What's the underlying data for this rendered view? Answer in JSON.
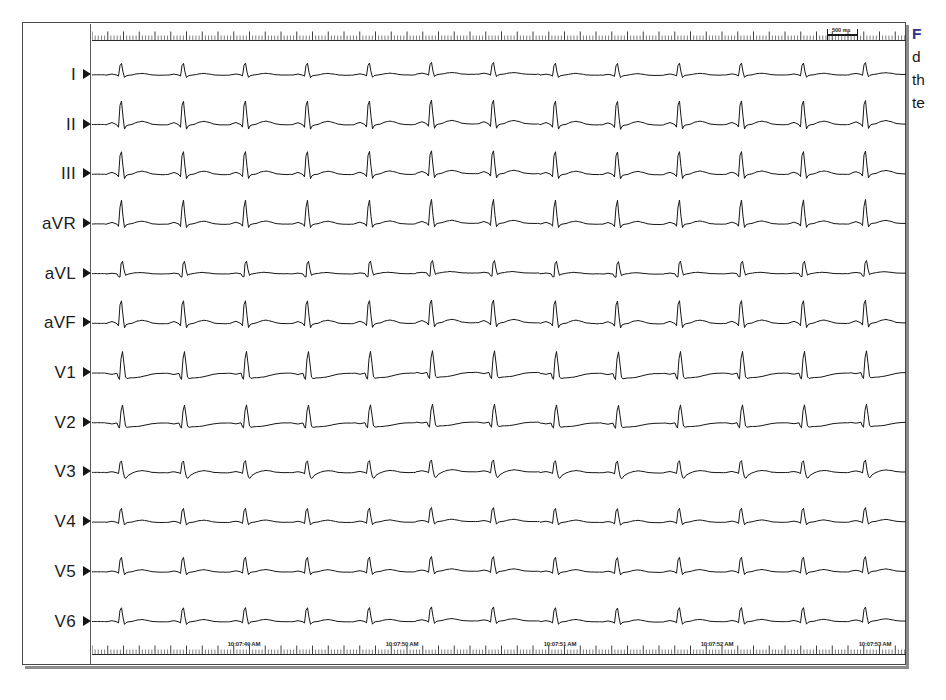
{
  "figure": {
    "kind": "12-lead-electrocardiogram",
    "caption_lead": "F",
    "caption_lines": [
      "d",
      "th",
      "te"
    ],
    "caption_lead_color": "#2e3192",
    "frame_color": "#4a4a4a",
    "trace_color": "#161616",
    "background": "#ffffff"
  },
  "ecg": {
    "leads": [
      {
        "label": "I",
        "morphology": "rs-upright-small",
        "amplitude": 1.0,
        "baseline_drift": 0.18
      },
      {
        "label": "II",
        "morphology": "r-upright-tall",
        "amplitude": 1.35,
        "baseline_drift": 0.14
      },
      {
        "label": "III",
        "morphology": "r-upright-tall",
        "amplitude": 1.3,
        "baseline_drift": 0.2
      },
      {
        "label": "aVR",
        "morphology": "qs-deep-negative",
        "amplitude": -1.55,
        "baseline_drift": 0.16
      },
      {
        "label": "aVL",
        "morphology": "rs-negative",
        "amplitude": -1.05,
        "baseline_drift": 0.22
      },
      {
        "label": "aVF",
        "morphology": "r-upright-tall",
        "amplitude": 1.3,
        "baseline_drift": 0.24
      },
      {
        "label": "V1",
        "morphology": "rS-deep-negative",
        "amplitude": -1.45,
        "baseline_drift": 0.18
      },
      {
        "label": "V2",
        "morphology": "rS-deep-negative",
        "amplitude": -1.2,
        "baseline_drift": 0.16
      },
      {
        "label": "V3",
        "morphology": "rs-biphasic",
        "amplitude": 0.95,
        "baseline_drift": 0.2
      },
      {
        "label": "V4",
        "morphology": "r-upright",
        "amplitude": 1.0,
        "baseline_drift": 0.14
      },
      {
        "label": "V5",
        "morphology": "r-upright",
        "amplitude": 1.05,
        "baseline_drift": 0.12
      },
      {
        "label": "V6",
        "morphology": "r-upright",
        "amplitude": 1.0,
        "baseline_drift": 0.12
      }
    ],
    "rhythm": "regular narrow-complex tachycardia",
    "beats_visible": 13,
    "beat_spacing_px": 62,
    "first_beat_offset_px": 14,
    "paper_speed": "25 mm/s",
    "calibration": {
      "label": "500 ms",
      "bar_width_px": 31,
      "bar_left_px": 735,
      "label_left_px": 740
    },
    "timestamps": [
      {
        "text": "10:07:49 AM",
        "x_px": 152
      },
      {
        "text": "10:07:50 AM",
        "x_px": 310
      },
      {
        "text": "10:07:51 AM",
        "x_px": 468
      },
      {
        "text": "10:07:52 AM",
        "x_px": 625
      },
      {
        "text": "10:07:53 AM",
        "x_px": 783
      }
    ],
    "ruler": {
      "minor_tick_spacing_px": 3.15,
      "major_tick_every": 5,
      "minor_tick_height_px": 5,
      "major_tick_height_px": 9
    },
    "geometry": {
      "trace_width_px": 814,
      "trace_height_px": 641,
      "lane_top_px": 20,
      "lane_height_px": 49.7
    }
  }
}
